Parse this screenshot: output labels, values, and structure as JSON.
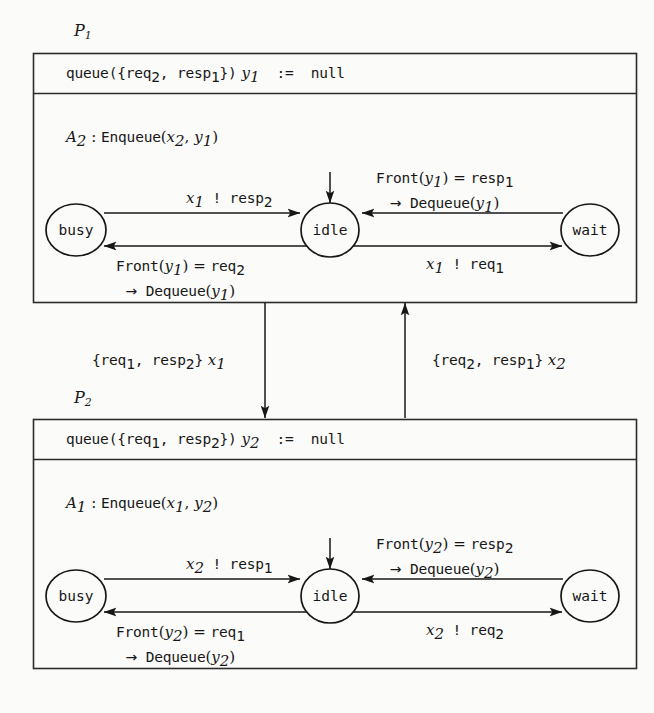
{
  "figure": {
    "type": "state-machine-diagram",
    "background_color": "#fbfbfa",
    "line_color": "#171717"
  },
  "processes": [
    {
      "tag": "P",
      "tag_sub": "1",
      "declaration": {
        "keyword": "queue",
        "text_plain": "queue({req2, resp1}) y1 := null",
        "set": [
          "req",
          "resp"
        ],
        "set_subs": [
          "2",
          "1"
        ],
        "var": "y",
        "var_sub": "1",
        "assign": ":=",
        "value": "null"
      },
      "action": {
        "name": "A",
        "name_sub": "2",
        "colon": ":",
        "op": "Enqueue",
        "args_plain": "(x2, y1)",
        "arg1": "x",
        "arg1_sub": "2",
        "arg2": "y",
        "arg2_sub": "1"
      },
      "states": [
        {
          "id": "busy",
          "label": "busy"
        },
        {
          "id": "idle",
          "label": "idle",
          "initial": true
        },
        {
          "id": "wait",
          "label": "wait"
        }
      ],
      "transitions": [
        {
          "from": "busy",
          "to": "idle",
          "position": "top-left",
          "line1_plain": "x1 ! resp2",
          "line1": {
            "var": "x",
            "var_sub": "1",
            "bang": "!",
            "msg": "resp",
            "msg_sub": "2"
          },
          "line2_plain": ""
        },
        {
          "from": "wait",
          "to": "idle",
          "position": "top-right",
          "line1_plain": "Front(y1) = resp1",
          "line1": {
            "fn": "Front",
            "arg": "y",
            "arg_sub": "1",
            "eq": "=",
            "val": "resp",
            "val_sub": "1"
          },
          "line2_plain": "-> Dequeue(y1)",
          "line2": {
            "arrow": "→",
            "fn": "Dequeue",
            "arg": "y",
            "arg_sub": "1"
          }
        },
        {
          "from": "idle",
          "to": "busy",
          "position": "bottom-left",
          "line1_plain": "Front(y1) = req2",
          "line1": {
            "fn": "Front",
            "arg": "y",
            "arg_sub": "1",
            "eq": "=",
            "val": "req",
            "val_sub": "2"
          },
          "line2_plain": "-> Dequeue(y1)",
          "line2": {
            "arrow": "→",
            "fn": "Dequeue",
            "arg": "y",
            "arg_sub": "1"
          }
        },
        {
          "from": "idle",
          "to": "wait",
          "position": "bottom-right",
          "line1_plain": "x1 ! req1",
          "line1": {
            "var": "x",
            "var_sub": "1",
            "bang": "!",
            "msg": "req",
            "msg_sub": "1"
          },
          "line2_plain": ""
        }
      ]
    },
    {
      "tag": "P",
      "tag_sub": "2",
      "declaration": {
        "keyword": "queue",
        "text_plain": "queue({req1, resp2}) y2 := null",
        "set": [
          "req",
          "resp"
        ],
        "set_subs": [
          "1",
          "2"
        ],
        "var": "y",
        "var_sub": "2",
        "assign": ":=",
        "value": "null"
      },
      "action": {
        "name": "A",
        "name_sub": "1",
        "colon": ":",
        "op": "Enqueue",
        "args_plain": "(x1, y2)",
        "arg1": "x",
        "arg1_sub": "1",
        "arg2": "y",
        "arg2_sub": "2"
      },
      "states": [
        {
          "id": "busy",
          "label": "busy"
        },
        {
          "id": "idle",
          "label": "idle",
          "initial": true
        },
        {
          "id": "wait",
          "label": "wait"
        }
      ],
      "transitions": [
        {
          "from": "busy",
          "to": "idle",
          "position": "top-left",
          "line1_plain": "x2 ! resp1",
          "line1": {
            "var": "x",
            "var_sub": "2",
            "bang": "!",
            "msg": "resp",
            "msg_sub": "1"
          },
          "line2_plain": ""
        },
        {
          "from": "wait",
          "to": "idle",
          "position": "top-right",
          "line1_plain": "Front(y2) = resp2",
          "line1": {
            "fn": "Front",
            "arg": "y",
            "arg_sub": "2",
            "eq": "=",
            "val": "resp",
            "val_sub": "2"
          },
          "line2_plain": "-> Dequeue(y2)",
          "line2": {
            "arrow": "→",
            "fn": "Dequeue",
            "arg": "y",
            "arg_sub": "2"
          }
        },
        {
          "from": "idle",
          "to": "busy",
          "position": "bottom-left",
          "line1_plain": "Front(y2) = req1",
          "line1": {
            "fn": "Front",
            "arg": "y",
            "arg_sub": "2",
            "eq": "=",
            "val": "req",
            "val_sub": "1"
          },
          "line2_plain": "-> Dequeue(y2)",
          "line2": {
            "arrow": "→",
            "fn": "Dequeue",
            "arg": "y",
            "arg_sub": "2"
          }
        },
        {
          "from": "idle",
          "to": "wait",
          "position": "bottom-right",
          "line1_plain": "x2 ! req2",
          "line1": {
            "var": "x",
            "var_sub": "2",
            "bang": "!",
            "msg": "req",
            "msg_sub": "2"
          }
        }
      ]
    }
  ],
  "channels": [
    {
      "id": "channel-x1",
      "direction": "down",
      "from": "P1",
      "to": "P2",
      "label_plain": "{req1, resp2} x1",
      "set": [
        "req",
        "resp"
      ],
      "set_subs": [
        "1",
        "2"
      ],
      "var": "x",
      "var_sub": "1"
    },
    {
      "id": "channel-x2",
      "direction": "up",
      "from": "P2",
      "to": "P1",
      "label_plain": "{req2, resp1} x2",
      "set": [
        "req",
        "resp"
      ],
      "set_subs": [
        "2",
        "1"
      ],
      "var": "x",
      "var_sub": "2"
    }
  ]
}
